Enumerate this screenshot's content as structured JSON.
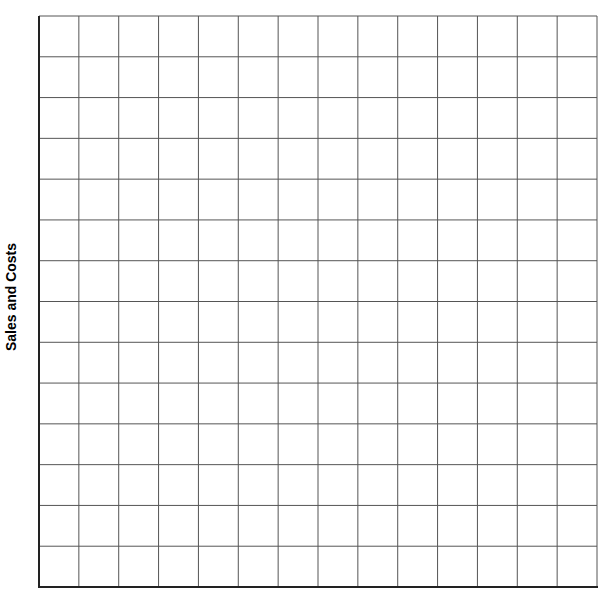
{
  "chart_data": {
    "type": "line",
    "title": "",
    "xlabel": "",
    "ylabel": "Sales and Costs",
    "series": [],
    "categories": [],
    "grid": true,
    "grid_columns": 14,
    "grid_rows": 14,
    "legend": null,
    "colors": {
      "grid": "#555555",
      "axis": "#222222",
      "background": "#ffffff"
    }
  }
}
